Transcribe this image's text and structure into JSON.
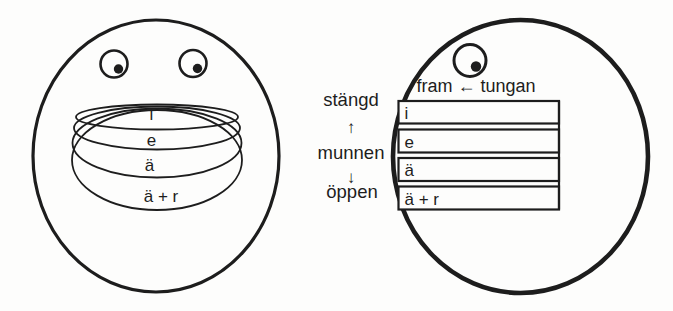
{
  "meta": {
    "ink_color": "#1d1d1d",
    "background": "#fdfdfc"
  },
  "left_figure": {
    "vowel_labels": [
      "i",
      "e",
      "ä",
      "ä + r"
    ]
  },
  "right_figure": {
    "tongue_label": "fram ← tungan",
    "row_labels": [
      "i",
      "e",
      "ä",
      "ä + r"
    ],
    "mouth_axis": {
      "closed_label": "stängd",
      "arrow_up": "↑",
      "middle_label": "munnen",
      "arrow_down": "↓",
      "open_label": "öppen"
    }
  }
}
